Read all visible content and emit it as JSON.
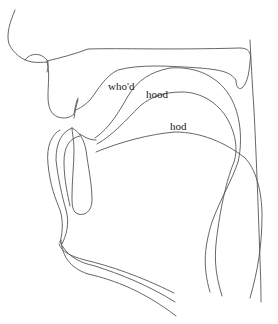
{
  "figure": {
    "title": "",
    "type": "midsagittal vocal tract tracings",
    "labels": [
      {
        "id": "whod",
        "text": "who'd",
        "x": 108,
        "y": 90
      },
      {
        "id": "hood",
        "text": "hood",
        "x": 146,
        "y": 98
      },
      {
        "id": "hod",
        "text": "hod",
        "x": 170,
        "y": 130
      }
    ],
    "stroke_color": "#555555",
    "background": "#ffffff"
  }
}
